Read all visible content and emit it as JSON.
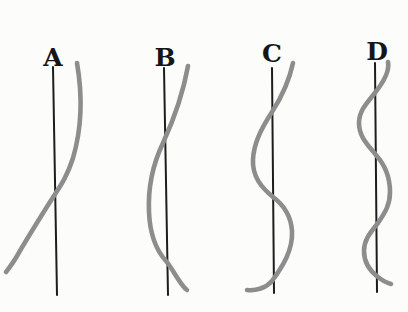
{
  "figure": {
    "type": "diagram",
    "colors": {
      "background": "#fcfcfb",
      "axis": "#1d1d1d",
      "curve": "#8d8d8d",
      "label": "#161616"
    },
    "panels": [
      {
        "label": "A",
        "curve_crossings": 1,
        "axis_path": "M 53 67 L 57 295",
        "curve_path": "M 77 63 C 82 92 83 124 73 158 C 66 180 58 189 50 202 C 40 218 28 237 17 256 C 13 263 9 268 6 272"
      },
      {
        "label": "B",
        "curve_crossings": 2,
        "axis_path": "M 164 68 L 168 295",
        "curve_path": "M 188 66 C 183 94 174 119 163 143 C 152 166 148 190 149 212 C 150 236 156 250 166 261 C 173 269 180 285 187 290"
      },
      {
        "label": "C",
        "curve_crossings": 3,
        "axis_path": "M 272 68 L 274 293",
        "curve_path": "M 293 63 C 289 82 281 98 272 112 C 261 129 254 143 253 159 C 252 177 262 188 273 197 C 285 206 291 216 292 231 C 293 250 283 266 272 281 C 266 288 256 291 247 290"
      },
      {
        "label": "D",
        "curve_crossings": 4,
        "axis_path": "M 375 63 L 377 292",
        "curve_path": "M 388 62 C 390 72 383 83 374 94 C 365 105 359 112 359 123 C 359 137 368 145 376 155 C 385 165 390 177 390 192 C 390 206 384 214 378 223 C 370 233 364 240 364 251 C 364 263 370 271 378 277 C 383 281 387 283 391 284"
      }
    ]
  }
}
